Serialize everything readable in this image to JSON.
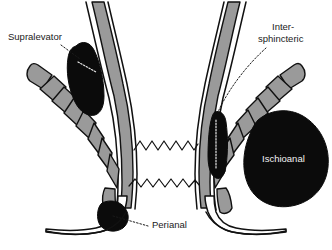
{
  "figure": {
    "background_color": "#ffffff",
    "width": 332,
    "height": 250
  },
  "palette": {
    "abscess_fill": "#0b0b0b",
    "muscle_fill": "#9a9a9a",
    "outline_stroke": "#111111",
    "label_dark": "#1a1a1a",
    "label_light": "#f2f2f2",
    "background": "#ffffff"
  },
  "labels": {
    "supralevator": "Supralevator",
    "intersphincteric_line1": "Inter-",
    "intersphincteric_line2": "sphincteric",
    "ischioanal": "Ischioanal",
    "perianal": "Perianal"
  },
  "structures": {
    "levator_ani_left": "levator-ani-muscle-left",
    "levator_ani_right": "levator-ani-muscle-right",
    "internal_sphincter_left": "internal-sphincter-left",
    "internal_sphincter_right": "internal-sphincter-right",
    "rectal_wall_left": "rectal-wall-left",
    "rectal_wall_right": "rectal-wall-right",
    "anal_canal": "anal-canal",
    "dentate_line": "dentate-line",
    "perineal_skin": "perineal-skin"
  },
  "abscesses": [
    {
      "id": "supralevator",
      "label": "Supralevator",
      "side": "left",
      "label_color": "#1a1a1a"
    },
    {
      "id": "intersphincteric",
      "label": "Inter-sphincteric",
      "side": "right",
      "label_color": "#1a1a1a"
    },
    {
      "id": "ischioanal",
      "label": "Ischioanal",
      "side": "right",
      "label_color": "#f2f2f2"
    },
    {
      "id": "perianal",
      "label": "Perianal",
      "side": "left",
      "label_color": "#1a1a1a"
    }
  ]
}
